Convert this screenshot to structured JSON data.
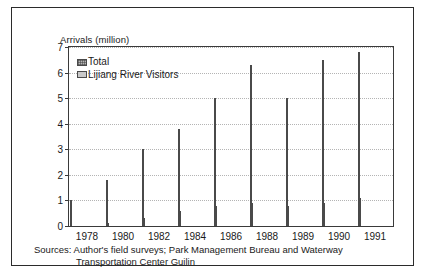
{
  "figure": {
    "ylabel": "Arrivals (million)",
    "source_line_1": "Sources: Author's field surveys; Park Management Bureau and Waterway",
    "source_line_2": "Transportation Center Guilin"
  },
  "chart_data": {
    "type": "bar",
    "title": "",
    "xlabel": "",
    "ylabel": "Arrivals (million)",
    "categories": [
      "1978",
      "1980",
      "1982",
      "1984",
      "1986",
      "1988",
      "1989",
      "1990",
      "1991"
    ],
    "series": [
      {
        "name": "Total",
        "values": [
          1.0,
          1.8,
          3.0,
          3.8,
          5.0,
          6.3,
          5.0,
          6.5,
          6.8
        ]
      },
      {
        "name": "Lijiang River Visitors",
        "values": [
          0.0,
          0.1,
          0.3,
          0.6,
          0.8,
          0.9,
          0.8,
          0.9,
          1.1
        ]
      }
    ],
    "ylim": [
      0,
      7
    ],
    "yticks": [
      0,
      1,
      2,
      3,
      4,
      5,
      6,
      7
    ],
    "ytick_labels": [
      "0",
      "1",
      "2",
      "3",
      "4",
      "5",
      "6",
      "7"
    ],
    "grid": true,
    "grid_style": "dotted-horizontal",
    "legend_position": "top-left-inside",
    "colors": {
      "total": "#b6b6b6",
      "lijiang": "#c9c9c9",
      "bar_border": "#4a4a4a",
      "axis": "#3a3a3a",
      "grid": "#b4b4b4",
      "frame": "#2b2b2b",
      "background": "#ffffff"
    }
  }
}
